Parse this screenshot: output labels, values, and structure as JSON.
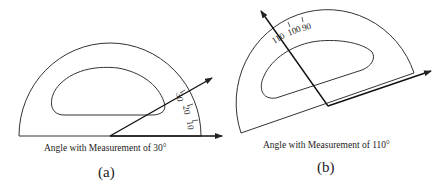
{
  "figures": [
    {
      "id": "a",
      "caption": "Angle with Measurement of 30°",
      "label": "(a)",
      "angle_degrees": 30,
      "scale_labels": [
        "30",
        "20",
        "10"
      ]
    },
    {
      "id": "b",
      "caption": "Angle with Measurement of 110°",
      "label": "(b)",
      "angle_degrees": 110,
      "scale_labels": [
        "110",
        "100",
        "90"
      ]
    }
  ],
  "colors": {
    "stroke": "#222222",
    "background": "#ffffff"
  }
}
